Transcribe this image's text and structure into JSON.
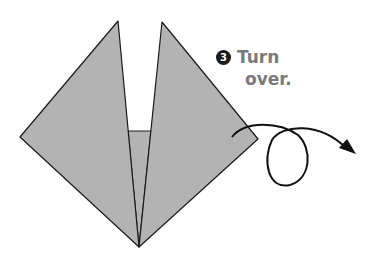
{
  "step": {
    "number": "3",
    "line1": "Turn",
    "line2": "over."
  },
  "colors": {
    "paper_fill": "#b3b3b3",
    "outline": "#1a1a1a",
    "text": "#7a7a7a",
    "background": "#ffffff"
  }
}
